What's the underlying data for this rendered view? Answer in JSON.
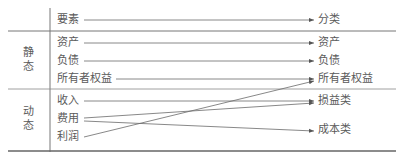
{
  "header": {
    "left": "要素",
    "right": "分类"
  },
  "groups": [
    {
      "label_line1": "静",
      "label_line2": "态"
    },
    {
      "label_line1": "动",
      "label_line2": "态"
    }
  ],
  "elements": [
    {
      "label": "资产"
    },
    {
      "label": "负债"
    },
    {
      "label": "所有者权益"
    },
    {
      "label": "收入"
    },
    {
      "label": "费用"
    },
    {
      "label": "利润"
    }
  ],
  "categories": [
    {
      "label": "资产"
    },
    {
      "label": "负债"
    },
    {
      "label": "所有者权益"
    },
    {
      "label": "损益类"
    },
    {
      "label": "成本类"
    }
  ],
  "mappings": [
    {
      "from": "要素",
      "to": "分类"
    },
    {
      "from": "资产",
      "to": "资产"
    },
    {
      "from": "负债",
      "to": "负债"
    },
    {
      "from": "所有者权益",
      "to": "所有者权益"
    },
    {
      "from": "利润",
      "to": "所有者权益"
    },
    {
      "from": "收入",
      "to": "损益类"
    },
    {
      "from": "费用",
      "to": "损益类"
    },
    {
      "from": "费用",
      "to": "成本类"
    }
  ],
  "colors": {
    "line": "#6a6a6a",
    "text": "#5a5a5a",
    "rule": "#777777"
  }
}
